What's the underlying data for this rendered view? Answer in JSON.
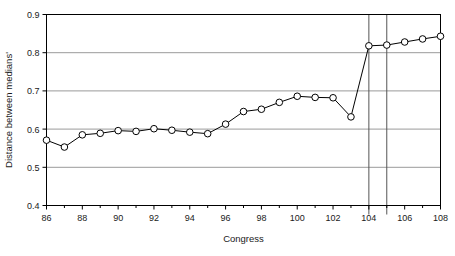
{
  "chart_data": {
    "type": "line",
    "title": "",
    "xlabel": "Congress",
    "ylabel": "Distance between medians'",
    "xlim": [
      86,
      108
    ],
    "ylim": [
      0.4,
      0.9
    ],
    "grid": true,
    "legend": "none",
    "marker": "open-circle",
    "x_ticks_major": [
      86,
      88,
      90,
      92,
      94,
      96,
      98,
      100,
      102,
      104,
      106,
      108
    ],
    "x_ticks_minor": [
      87,
      89,
      91,
      93,
      95,
      97,
      99,
      101,
      103,
      105,
      107
    ],
    "x_tick_labels": [
      "86",
      "88",
      "90",
      "92",
      "94",
      "96",
      "98",
      "100",
      "102",
      "104",
      "106",
      "108"
    ],
    "y_ticks": [
      0.4,
      0.5,
      0.6,
      0.7,
      0.8,
      0.9
    ],
    "y_tick_labels": [
      "0.4",
      "0.5",
      "0.6",
      "0.7",
      "0.8",
      "0.9"
    ],
    "x": [
      86,
      87,
      88,
      89,
      90,
      91,
      92,
      93,
      94,
      95,
      96,
      97,
      98,
      99,
      100,
      101,
      102,
      103,
      104,
      105,
      106,
      107,
      108
    ],
    "values": [
      0.571,
      0.553,
      0.585,
      0.589,
      0.596,
      0.594,
      0.601,
      0.597,
      0.592,
      0.588,
      0.613,
      0.646,
      0.652,
      0.67,
      0.686,
      0.683,
      0.682,
      0.632,
      0.818,
      0.82,
      0.828,
      0.836,
      0.843
    ],
    "vertical_reference_lines": [
      104,
      105
    ],
    "series": [
      {
        "name": "Distance between medians",
        "values": [
          0.571,
          0.553,
          0.585,
          0.589,
          0.596,
          0.594,
          0.601,
          0.597,
          0.592,
          0.588,
          0.613,
          0.646,
          0.652,
          0.67,
          0.686,
          0.683,
          0.682,
          0.632,
          0.818,
          0.82,
          0.828,
          0.836,
          0.843
        ]
      }
    ]
  },
  "style": {
    "line_color": "#000000",
    "marker_fill": "#ffffff",
    "marker_stroke": "#000000",
    "grid_color": "#9a9a9a",
    "axis_color": "#000000",
    "background": "#ffffff"
  }
}
